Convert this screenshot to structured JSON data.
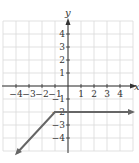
{
  "chart_data": {
    "type": "line",
    "title": "",
    "xlabel": "x",
    "ylabel": "y",
    "xlim": [
      -5,
      5
    ],
    "ylim": [
      -5,
      5
    ],
    "grid": true,
    "x_ticks": [
      "-4",
      "-3",
      "-2",
      "-1",
      "1",
      "2",
      "3",
      "4"
    ],
    "y_ticks": [
      "4",
      "3",
      "2",
      "1",
      "-1",
      "-2",
      "-3",
      "-4"
    ],
    "series": [
      {
        "name": "piecewise",
        "segments": [
          {
            "from": [
              -1,
              -2
            ],
            "to": [
              -4.9,
              -5.9
            ],
            "arrow_end": true,
            "rule": "y = x - 1, x <= -1"
          },
          {
            "from": [
              -1,
              -2
            ],
            "to": [
              5,
              -2
            ],
            "arrow_end": true,
            "rule": "y = -2, x >= -1"
          }
        ]
      }
    ],
    "colors": {
      "grid": "#d9d9d9",
      "axes": "#333333",
      "line": "#666666"
    }
  },
  "labels": {
    "x_axis": "x",
    "y_axis": "y",
    "x_ticks": [
      {
        "text": "-4",
        "x": -4
      },
      {
        "text": "-3",
        "x": -3
      },
      {
        "text": "-2",
        "x": -2
      },
      {
        "text": "-1",
        "x": -1
      },
      {
        "text": "1",
        "x": 1
      },
      {
        "text": "2",
        "x": 2
      },
      {
        "text": "3",
        "x": 3
      },
      {
        "text": "4",
        "x": 4
      }
    ],
    "y_ticks": [
      {
        "text": "4",
        "y": 4
      },
      {
        "text": "3",
        "y": 3
      },
      {
        "text": "2",
        "y": 2
      },
      {
        "text": "1",
        "y": 1
      },
      {
        "text": "-1",
        "y": -1
      },
      {
        "text": "-2",
        "y": -2
      },
      {
        "text": "-3",
        "y": -3
      },
      {
        "text": "-4",
        "y": -4
      }
    ]
  }
}
